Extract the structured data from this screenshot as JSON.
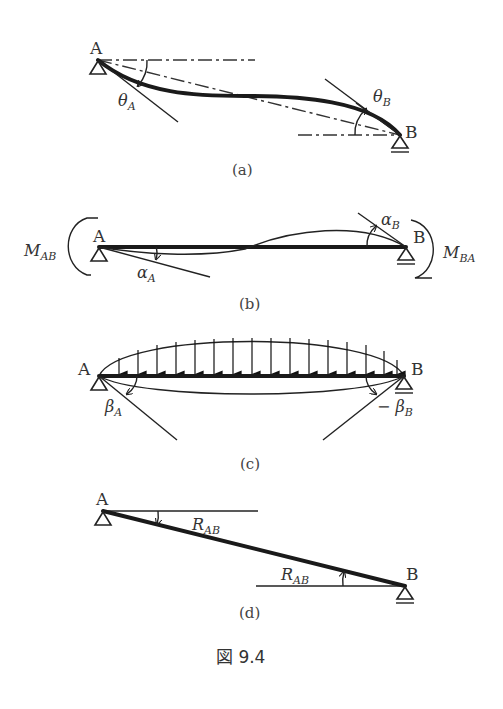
{
  "figure": {
    "caption": "図 9.4",
    "panels": [
      {
        "id": "a",
        "label": "(a)",
        "node_a": "A",
        "node_b": "B",
        "angle_a": "θ",
        "angle_a_sub": "A",
        "angle_b": "θ",
        "angle_b_sub": "B"
      },
      {
        "id": "b",
        "label": "(b)",
        "node_a": "A",
        "node_b": "B",
        "moment_a": "M",
        "moment_a_sub": "AB",
        "moment_b": "M",
        "moment_b_sub": "BA",
        "angle_a": "α",
        "angle_a_sub": "A",
        "angle_b": "α",
        "angle_b_sub": "B"
      },
      {
        "id": "c",
        "label": "(c)",
        "node_a": "A",
        "node_b": "B",
        "angle_a": "β",
        "angle_a_sub": "A",
        "angle_b": "− β",
        "angle_b_sub": "B",
        "load_arrow_count": 16
      },
      {
        "id": "d",
        "label": "(d)",
        "node_a": "A",
        "node_b": "B",
        "angle_top": "R",
        "angle_top_sub": "AB",
        "angle_bottom": "R",
        "angle_bottom_sub": "AB"
      }
    ]
  }
}
